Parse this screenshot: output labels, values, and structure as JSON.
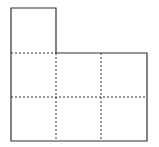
{
  "diagram": {
    "title": "",
    "colors": {
      "stroke": "#333333",
      "dashed": "#333333",
      "background": "#ffffff"
    },
    "geometry": {
      "cell_size": 45,
      "origin_x": 11,
      "origin_y": 8,
      "columns": 3,
      "rows_bottom": 2,
      "top_cells": 1
    },
    "cells": [
      {
        "row": 0,
        "col": 0
      },
      {
        "row": 1,
        "col": 0
      },
      {
        "row": 1,
        "col": 1
      },
      {
        "row": 1,
        "col": 2
      },
      {
        "row": 2,
        "col": 0
      },
      {
        "row": 2,
        "col": 1
      },
      {
        "row": 2,
        "col": 2
      }
    ]
  }
}
